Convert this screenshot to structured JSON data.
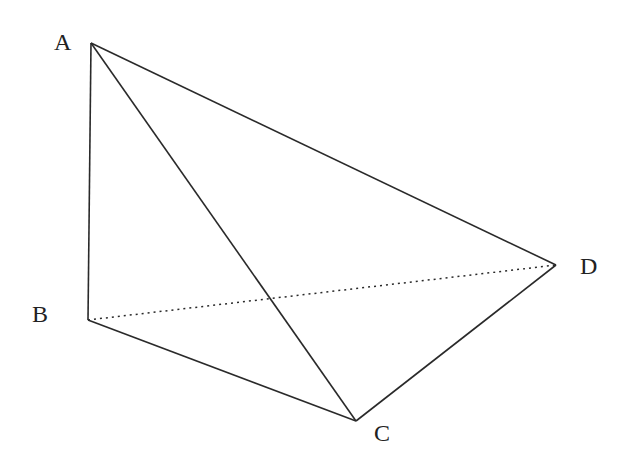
{
  "diagram": {
    "type": "tetrahedron",
    "vertices": {
      "A": {
        "label": "A",
        "x": 91,
        "y": 43
      },
      "B": {
        "label": "B",
        "x": 88,
        "y": 320
      },
      "C": {
        "label": "C",
        "x": 356,
        "y": 421
      },
      "D": {
        "label": "D",
        "x": 556,
        "y": 265
      }
    },
    "edges": [
      {
        "from": "A",
        "to": "B",
        "style": "solid"
      },
      {
        "from": "A",
        "to": "C",
        "style": "solid"
      },
      {
        "from": "A",
        "to": "D",
        "style": "solid"
      },
      {
        "from": "B",
        "to": "C",
        "style": "solid"
      },
      {
        "from": "C",
        "to": "D",
        "style": "solid"
      },
      {
        "from": "B",
        "to": "D",
        "style": "dotted"
      }
    ],
    "labels": {
      "A": "A",
      "B": "B",
      "C": "C",
      "D": "D"
    }
  }
}
